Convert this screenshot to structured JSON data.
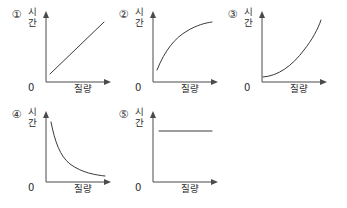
{
  "question_options": [
    {
      "marker": "①",
      "y_label": "시\n간",
      "x_label": "질량",
      "origin_label": "0",
      "curve_shape": "linear-increasing",
      "path": "M 44 70 L 98 18"
    },
    {
      "marker": "②",
      "y_label": "시\n간",
      "x_label": "질량",
      "origin_label": "0",
      "curve_shape": "concave-down-increasing",
      "path": "M 44 66 C 52 46, 62 34, 74 27 C 84 21, 92 19, 99 18"
    },
    {
      "marker": "③",
      "y_label": "시\n간",
      "x_label": "질량",
      "origin_label": "0",
      "curve_shape": "convex-increasing",
      "path": "M 41 73 C 56 72, 70 62, 82 46 C 90 36, 96 25, 99 16"
    },
    {
      "marker": "④",
      "y_label": "시\n간",
      "x_label": "질량",
      "origin_label": "0",
      "curve_shape": "inverse-decreasing",
      "path": "M 45 18 C 49 38, 54 52, 64 60 C 76 69, 90 71, 99 72"
    },
    {
      "marker": "⑤",
      "y_label": "시\n간",
      "x_label": "질량",
      "origin_label": "0",
      "curve_shape": "constant-horizontal",
      "path": "M 46 27 L 99 27"
    }
  ],
  "colors": {
    "background": "#ffffff",
    "axis": "#4a4a4a",
    "curve": "#3a3a3a",
    "text": "#2b2b2b"
  }
}
